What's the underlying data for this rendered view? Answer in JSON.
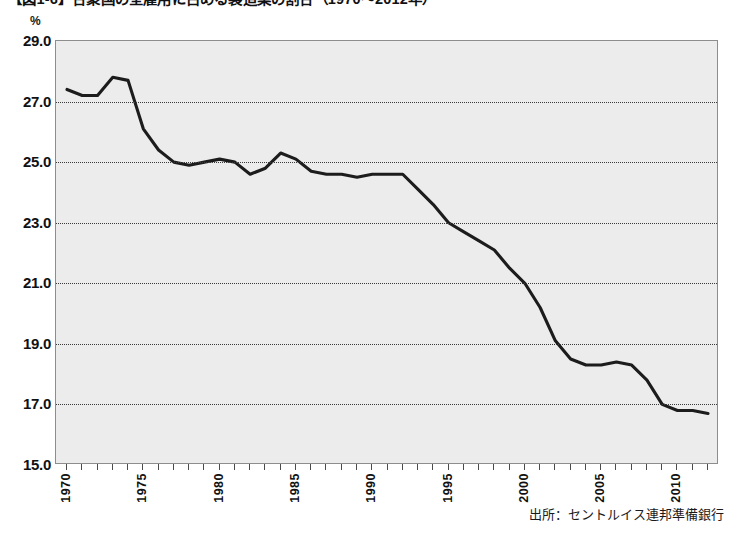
{
  "figure": {
    "title": "【図1-6】合衆国の全雇用に占める製造業の割合（1970～2012年）",
    "unit_label": "%",
    "source_note": "出所：セントルイス連邦準備銀行"
  },
  "chart_data": {
    "type": "line",
    "title": "【図1-6】合衆国の全雇用に占める製造業の割合（1970～2012年）",
    "xlabel": "",
    "ylabel": "%",
    "ylim": [
      15.0,
      29.0
    ],
    "xlim": [
      1970,
      2012
    ],
    "ytick_labels": [
      "29.0",
      "27.0",
      "25.0",
      "23.0",
      "21.0",
      "19.0",
      "17.0",
      "15.0"
    ],
    "yticks": [
      29.0,
      27.0,
      25.0,
      23.0,
      21.0,
      19.0,
      17.0,
      15.0
    ],
    "xtick_labels": [
      "1970",
      "1975",
      "1980",
      "1985",
      "1990",
      "1995",
      "2000",
      "2005",
      "2010"
    ],
    "xticks": [
      1970,
      1975,
      1980,
      1985,
      1990,
      1995,
      2000,
      2005,
      2010
    ],
    "xtick_step_minor": 1,
    "grid": "horizontal-dotted",
    "legend": "none",
    "line_color": "#1c1c1c",
    "plot_background": "#ececec",
    "series": [
      {
        "name": "合衆国の全雇用に占める製造業の割合",
        "x": [
          1970,
          1971,
          1972,
          1973,
          1974,
          1975,
          1976,
          1977,
          1978,
          1979,
          1980,
          1981,
          1982,
          1983,
          1984,
          1985,
          1986,
          1987,
          1988,
          1989,
          1990,
          1991,
          1992,
          1993,
          1994,
          1995,
          1996,
          1997,
          1998,
          1999,
          2000,
          2001,
          2002,
          2003,
          2004,
          2005,
          2006,
          2007,
          2008,
          2009,
          2010,
          2011,
          2012
        ],
        "values": [
          27.4,
          27.2,
          27.2,
          27.8,
          27.7,
          26.1,
          25.4,
          25.0,
          24.9,
          25.0,
          25.1,
          25.0,
          24.6,
          24.8,
          25.3,
          25.1,
          24.7,
          24.6,
          24.6,
          24.5,
          24.6,
          24.6,
          24.6,
          24.1,
          23.6,
          23.0,
          22.7,
          22.4,
          22.1,
          21.5,
          21.0,
          20.2,
          19.1,
          18.5,
          18.3,
          18.3,
          18.4,
          18.3,
          17.8,
          17.0,
          16.8,
          16.8,
          16.7
        ]
      }
    ]
  },
  "y_axis": {
    "ticks": [
      {
        "label": "29.0",
        "value": 29.0
      },
      {
        "label": "27.0",
        "value": 27.0
      },
      {
        "label": "25.0",
        "value": 25.0
      },
      {
        "label": "23.0",
        "value": 23.0
      },
      {
        "label": "21.0",
        "value": 21.0
      },
      {
        "label": "19.0",
        "value": 19.0
      },
      {
        "label": "17.0",
        "value": 17.0
      },
      {
        "label": "15.0",
        "value": 15.0
      }
    ]
  },
  "x_axis": {
    "labeled_ticks": [
      {
        "label": "1970",
        "value": 1970
      },
      {
        "label": "1975",
        "value": 1975
      },
      {
        "label": "1980",
        "value": 1980
      },
      {
        "label": "1985",
        "value": 1985
      },
      {
        "label": "1990",
        "value": 1990
      },
      {
        "label": "1995",
        "value": 1995
      },
      {
        "label": "2000",
        "value": 2000
      },
      {
        "label": "2005",
        "value": 2005
      },
      {
        "label": "2010",
        "value": 2010
      }
    ]
  }
}
